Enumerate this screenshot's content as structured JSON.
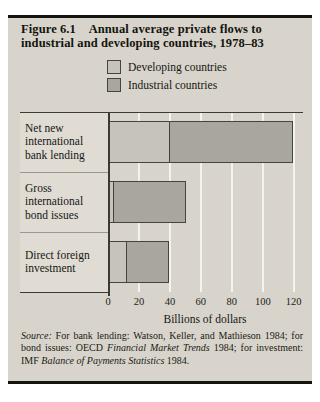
{
  "figure": {
    "title_line1": "Figure 6.1  Annual average private flows to",
    "title_line2": "industrial and developing countries, 1978–83"
  },
  "legend": [
    {
      "label": "Developing countries",
      "color": "#c6c4ba"
    },
    {
      "label": "Industrial countries",
      "color": "#a8a69d"
    }
  ],
  "chart_data": {
    "type": "bar",
    "orientation": "horizontal",
    "stacked": true,
    "categories": [
      "Net new international bank lending",
      "Gross international bond issues",
      "Direct foreign investment"
    ],
    "series": [
      {
        "name": "Developing countries",
        "color": "#c6c4ba",
        "values": [
          40,
          4,
          12
        ]
      },
      {
        "name": "Industrial countries",
        "color": "#a8a69d",
        "values": [
          80,
          47,
          28
        ]
      }
    ],
    "totals": [
      120,
      51,
      40
    ],
    "xlabel": "Billions of dollars",
    "xticks": [
      0,
      20,
      40,
      60,
      80,
      100,
      120
    ],
    "xlim": [
      0,
      126
    ],
    "grid": true,
    "gridline_color": "#f5f3ed",
    "bar_border_color": "#45453e"
  },
  "source_note": {
    "segments": [
      {
        "text": "Source:",
        "italic": true
      },
      {
        "text": " For bank lending: Watson, Keller, and Mathieson 1984; for bond issues: OECD ",
        "italic": false
      },
      {
        "text": "Financial Market Trends",
        "italic": true
      },
      {
        "text": " 1984; for investment: IMF ",
        "italic": false
      },
      {
        "text": "Balance of Payments Statistics",
        "italic": true
      },
      {
        "text": " 1984.",
        "italic": false
      }
    ]
  }
}
